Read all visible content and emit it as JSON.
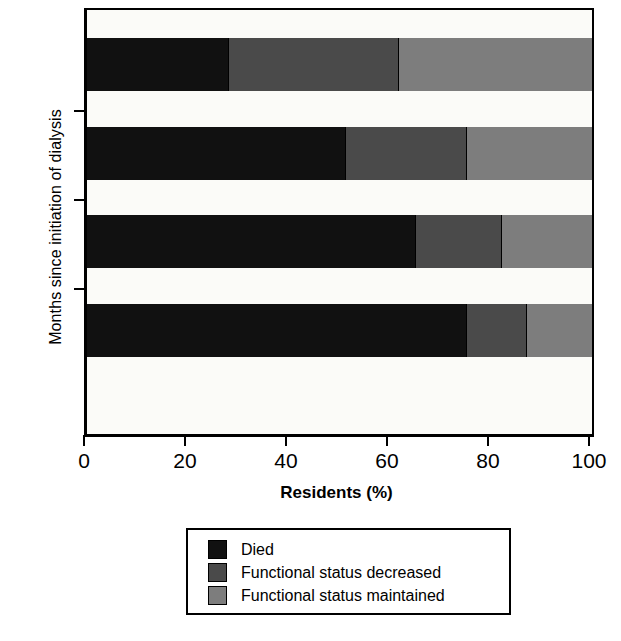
{
  "chart_data": {
    "type": "bar",
    "orientation": "horizontal",
    "stacked": true,
    "title": "",
    "xlabel": "Residents (%)",
    "ylabel": "Months since initiation of dialysis",
    "categories": [
      "3",
      "6",
      "9",
      "12"
    ],
    "xlim": [
      0,
      100
    ],
    "xticks": [
      0,
      20,
      40,
      60,
      80,
      100
    ],
    "xtick_labels": [
      "0",
      "20",
      "40",
      "60",
      "80",
      "100"
    ],
    "grid": false,
    "legend_position": "below-axes",
    "series": [
      {
        "name": "Died",
        "color": "#111111",
        "values": [
          28,
          51,
          65,
          75
        ]
      },
      {
        "name": "Functional status decreased",
        "color": "#4a4a4a",
        "values": [
          33.5,
          24,
          17,
          12
        ]
      },
      {
        "name": "Functional status maintained",
        "color": "#7d7d7d",
        "values": [
          38.5,
          25,
          18,
          13
        ]
      }
    ],
    "cumulative_boundaries": [
      [
        28,
        61.5,
        100
      ],
      [
        51,
        75,
        100
      ],
      [
        65,
        82,
        100
      ],
      [
        75,
        87,
        100
      ]
    ]
  }
}
